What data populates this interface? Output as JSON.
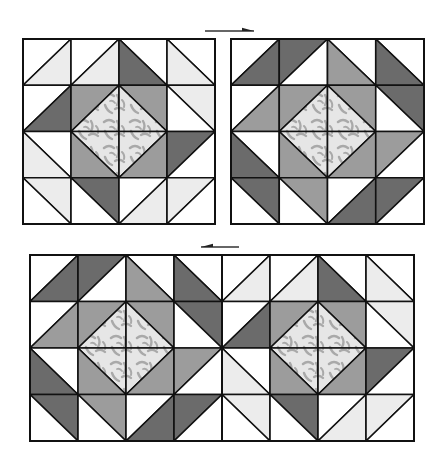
{
  "diagram": {
    "colors": {
      "white": "#ffffff",
      "light": "#ececec",
      "medium": "#9c9c9c",
      "dark": "#6b6b6b",
      "print_base": "#e6e6e6",
      "print_motif": "#a9a9a9",
      "line": "#111111"
    },
    "legend_note": "Cell spec: d='/' halves a=upper-left, b=lower-right; d='\\' halves a=upper-right, b=lower-left",
    "block_types": {
      "A": [
        [
          {
            "d": "/",
            "a": "white",
            "b": "light"
          },
          {
            "d": "/",
            "a": "white",
            "b": "light"
          },
          {
            "d": "\\",
            "a": "white",
            "b": "dark"
          },
          {
            "d": "\\",
            "a": "white",
            "b": "light"
          }
        ],
        [
          {
            "d": "/",
            "a": "white",
            "b": "dark"
          },
          {
            "d": "/",
            "a": "medium",
            "b": "print"
          },
          {
            "d": "\\",
            "a": "medium",
            "b": "print"
          },
          {
            "d": "\\",
            "a": "light",
            "b": "white"
          }
        ],
        [
          {
            "d": "\\",
            "a": "white",
            "b": "light"
          },
          {
            "d": "\\",
            "a": "print",
            "b": "medium"
          },
          {
            "d": "/",
            "a": "print",
            "b": "medium"
          },
          {
            "d": "/",
            "a": "dark",
            "b": "white"
          }
        ],
        [
          {
            "d": "\\",
            "a": "light",
            "b": "white"
          },
          {
            "d": "\\",
            "a": "dark",
            "b": "white"
          },
          {
            "d": "/",
            "a": "white",
            "b": "light"
          },
          {
            "d": "/",
            "a": "light",
            "b": "white"
          }
        ]
      ],
      "B": [
        [
          {
            "d": "/",
            "a": "white",
            "b": "dark"
          },
          {
            "d": "/",
            "a": "dark",
            "b": "white"
          },
          {
            "d": "\\",
            "a": "white",
            "b": "medium"
          },
          {
            "d": "\\",
            "a": "white",
            "b": "dark"
          }
        ],
        [
          {
            "d": "/",
            "a": "white",
            "b": "medium"
          },
          {
            "d": "/",
            "a": "medium",
            "b": "print"
          },
          {
            "d": "\\",
            "a": "medium",
            "b": "print"
          },
          {
            "d": "\\",
            "a": "dark",
            "b": "white"
          }
        ],
        [
          {
            "d": "\\",
            "a": "white",
            "b": "dark"
          },
          {
            "d": "\\",
            "a": "print",
            "b": "medium"
          },
          {
            "d": "/",
            "a": "print",
            "b": "medium"
          },
          {
            "d": "/",
            "a": "medium",
            "b": "white"
          }
        ],
        [
          {
            "d": "\\",
            "a": "dark",
            "b": "white"
          },
          {
            "d": "\\",
            "a": "medium",
            "b": "white"
          },
          {
            "d": "/",
            "a": "white",
            "b": "dark"
          },
          {
            "d": "/",
            "a": "dark",
            "b": "white"
          }
        ]
      ]
    },
    "blocks": [
      {
        "name": "block-top-left",
        "type": "A",
        "x": 23,
        "y": 39,
        "w": 192,
        "h": 185
      },
      {
        "name": "block-top-right",
        "type": "B",
        "x": 231,
        "y": 39,
        "w": 193,
        "h": 185
      },
      {
        "name": "strip-bottom-left-block",
        "type": "B",
        "x": 30,
        "y": 255,
        "w": 192,
        "h": 186
      },
      {
        "name": "strip-bottom-right-block",
        "type": "A",
        "x": 222,
        "y": 255,
        "w": 192,
        "h": 186
      }
    ],
    "arrows": [
      {
        "name": "arrow-right",
        "direction": "right",
        "x1": 205,
        "x2": 254,
        "y": 31
      },
      {
        "name": "arrow-left",
        "direction": "left",
        "x1": 201,
        "x2": 239,
        "y": 247
      }
    ]
  }
}
